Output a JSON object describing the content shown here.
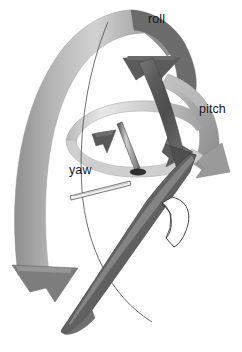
{
  "figure": {
    "background_color": "#ffffff",
    "labels": {
      "roll": "roll",
      "pitch": "pitch",
      "yaw": "yaw"
    },
    "label_positions": {
      "roll": {
        "x": 148,
        "y": 23
      },
      "pitch": {
        "x": 199,
        "y": 113
      },
      "yaw": {
        "x": 69,
        "y": 174
      }
    },
    "colors": {
      "label_text": "#17171a",
      "ribbon_light": "#d8d8d8",
      "ribbon_mid": "#a9a9a9",
      "ribbon_dark": "#6e6e6e",
      "arrowhead_dark": "#5e5e5e",
      "arrowhead_darkest": "#4a4a4a",
      "body_dark": "#555555",
      "body_mid": "#8d8d8d",
      "outline": "#3a3a3a",
      "white": "#ffffff"
    },
    "elements": [
      {
        "name": "roll-arrow-ribbon",
        "axis": "roll",
        "kind": "curved-band-arrow",
        "direction": "over-the-top-descending-left"
      },
      {
        "name": "roll-arrowhead",
        "axis": "roll",
        "kind": "arrowhead",
        "direction": "down-left"
      },
      {
        "name": "roll-arrow-tail-arrowhead",
        "axis": "roll",
        "kind": "arrowhead",
        "direction": "down"
      },
      {
        "name": "pitch-arrow-ribbon",
        "axis": "pitch",
        "kind": "curved-band-arrow",
        "direction": "clockwise-right"
      },
      {
        "name": "pitch-arrowhead",
        "axis": "pitch",
        "kind": "arrowhead",
        "direction": "down-left"
      },
      {
        "name": "yaw-arrow-ellipse",
        "axis": "yaw",
        "kind": "elliptical-band-arrow",
        "direction": "counter-clockwise-horizontal"
      },
      {
        "name": "yaw-arrowhead-left",
        "axis": "yaw",
        "kind": "arrowhead",
        "direction": "up-left"
      },
      {
        "name": "yaw-arrowhead-right",
        "axis": "yaw",
        "kind": "arrowhead",
        "direction": "right"
      },
      {
        "name": "aircraft-body",
        "kind": "swept-blade",
        "orientation": "diagonal-upper-right-to-lower-left"
      },
      {
        "name": "vertical-pin",
        "kind": "post",
        "orientation": "vertical"
      },
      {
        "name": "probe-needle",
        "kind": "thin-rod",
        "orientation": "horizontal-left"
      },
      {
        "name": "fin-outline",
        "kind": "flag-outline",
        "orientation": "lower-right"
      }
    ]
  }
}
